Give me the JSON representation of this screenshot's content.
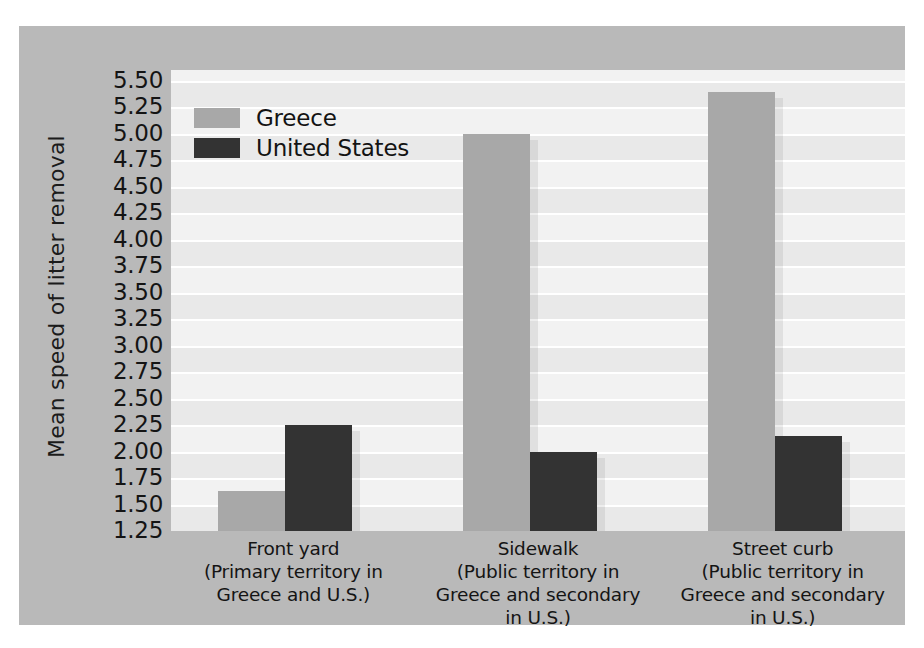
{
  "chart_data": {
    "type": "bar",
    "title": "",
    "xlabel": "",
    "ylabel": "Mean speed of litter removal",
    "ylim": [
      1.25,
      5.5
    ],
    "ytick_step": 0.25,
    "grid": true,
    "legend_position": "top-left",
    "categories": [
      "Front yard\n(Primary territory in\nGreece and U.S.)",
      "Sidewalk\n(Public territory in\nGreece and secondary\nin U.S.)",
      "Street curb\n(Public territory in\nGreece and secondary\nin U.S.)"
    ],
    "category_lines": [
      [
        "Front yard",
        "(Primary territory in",
        "Greece and U.S.)"
      ],
      [
        "Sidewalk",
        "(Public territory in",
        "Greece and secondary",
        "in U.S.)"
      ],
      [
        "Street curb",
        "(Public territory in",
        "Greece and secondary",
        "in U.S.)"
      ]
    ],
    "series": [
      {
        "name": "Greece",
        "color": "#a8a8a8",
        "values": [
          1.63,
          5.0,
          5.4
        ]
      },
      {
        "name": "United States",
        "color": "#333333",
        "values": [
          2.25,
          2.0,
          2.15
        ]
      }
    ],
    "yticks": [
      "5.50",
      "5.25",
      "5.00",
      "4.75",
      "4.50",
      "4.25",
      "4.00",
      "3.75",
      "3.50",
      "3.25",
      "3.00",
      "2.75",
      "2.50",
      "2.25",
      "2.00",
      "1.75",
      "1.50",
      "1.25"
    ],
    "ytick_values": [
      5.5,
      5.25,
      5.0,
      4.75,
      4.5,
      4.25,
      4.0,
      3.75,
      3.5,
      3.25,
      3.0,
      2.75,
      2.5,
      2.25,
      2.0,
      1.75,
      1.5,
      1.25
    ]
  },
  "legend": {
    "items": [
      {
        "label": "Greece",
        "color": "#a8a8a8"
      },
      {
        "label": "United States",
        "color": "#333333"
      }
    ]
  },
  "colors": {
    "panel_background": "#b9b9b9",
    "plot_background": "#f2f2f2",
    "gridline": "#ffffff",
    "band": "#e9e9e9",
    "text": "#141414",
    "greece_bar": "#a8a8a8",
    "us_bar": "#333333"
  }
}
